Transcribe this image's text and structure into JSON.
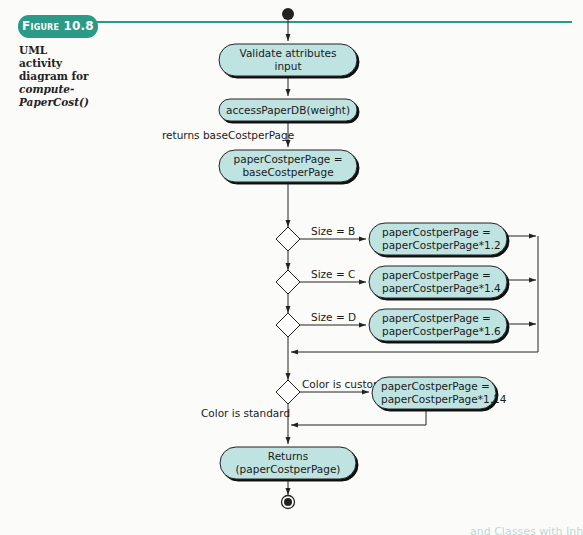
{
  "figure": {
    "label_prefix": "Figure",
    "number": "10.8",
    "caption_line1": "UML activity",
    "caption_line2": "diagram for",
    "caption_italic1": "compute-",
    "caption_italic2": "PaperCost()"
  },
  "colors": {
    "accent": "#2b9a86",
    "node_fill": "#bfe3e1",
    "line": "#222222"
  },
  "diagram": {
    "start_node": "initial-node",
    "actions": {
      "validate": [
        "Validate attributes",
        "input"
      ],
      "access_db": [
        "accessPaperDB(weight)"
      ],
      "assign_base": [
        "paperCostperPage =",
        "baseCostperPage"
      ],
      "size_b": [
        "paperCostperPage =",
        "paperCostperPage*1.2"
      ],
      "size_c": [
        "paperCostperPage =",
        "paperCostperPage*1.4"
      ],
      "size_d": [
        "paperCostperPage =",
        "paperCostperPage*1.6"
      ],
      "color_custom": [
        "paperCostperPage =",
        "paperCostperPage*1.14"
      ],
      "returns": [
        "Returns",
        "(paperCostperPage)"
      ]
    },
    "labels": {
      "returns_base": "returns baseCostperPage",
      "guard_b": "Size = B",
      "guard_c": "Size = C",
      "guard_d": "Size = D",
      "guard_custom": "Color is custom",
      "guard_standard": "Color is standard"
    },
    "end_node": "final-node"
  },
  "bleed_text": "and Classes with Inh"
}
